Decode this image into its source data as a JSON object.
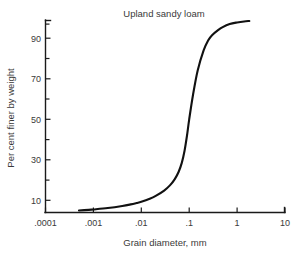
{
  "chart_data": {
    "type": "line",
    "title": "Upland sandy loam",
    "xlabel": "Grain diameter, mm",
    "ylabel": "Per cent finer by weight",
    "xscale": "log",
    "yscale": "linear",
    "xlim": [
      0.0001,
      10
    ],
    "ylim": [
      4,
      99
    ],
    "grid": false,
    "legend": null,
    "xticks": [
      0.0001,
      0.001,
      0.01,
      0.1,
      1,
      10
    ],
    "xticklabels": [
      ".0001",
      ".001",
      ".01",
      ".1",
      "1",
      "10"
    ],
    "yticks": [
      10,
      30,
      50,
      70,
      90
    ],
    "yticklabels": [
      "10",
      "30",
      "50",
      "70",
      "90"
    ],
    "yminorticks": [
      20,
      40,
      60,
      80,
      97
    ],
    "series": [
      {
        "name": "Upland sandy loam",
        "color": "#111111",
        "x": [
          0.0005,
          0.0008,
          0.001,
          0.002,
          0.004,
          0.006,
          0.008,
          0.01,
          0.015,
          0.02,
          0.03,
          0.04,
          0.05,
          0.06,
          0.07,
          0.08,
          0.09,
          0.1,
          0.12,
          0.15,
          0.2,
          0.25,
          0.3,
          0.4,
          0.5,
          0.7,
          1.0,
          1.4,
          1.8
        ],
        "y": [
          5.0,
          5.3,
          5.5,
          6.2,
          7.2,
          8.0,
          8.7,
          9.3,
          10.8,
          12.2,
          14.8,
          17.5,
          20.5,
          24.0,
          28.5,
          34.5,
          42.0,
          50.0,
          62.0,
          74.0,
          84.0,
          89.0,
          91.5,
          94.0,
          95.5,
          97.0,
          97.8,
          98.3,
          98.5
        ]
      }
    ]
  },
  "axes": {
    "tick_direction": "inward",
    "frame_sides": [
      "left",
      "bottom"
    ],
    "background": "#ffffff",
    "line_color": "#1a1a1a",
    "text_color": "#3a3a3a"
  }
}
